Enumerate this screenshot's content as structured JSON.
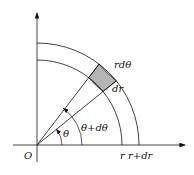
{
  "diagram": {
    "labels": {
      "origin": "O",
      "r_axis": "r",
      "r_plus_dr_axis": "r+dr",
      "theta": "θ",
      "theta_plus_dtheta": "θ+dθ",
      "arc_length": "rdθ",
      "radial_width": "dr"
    },
    "colors": {
      "line": "#111111",
      "shade": "#b4b4b4"
    },
    "geometry": {
      "origin": [
        37,
        145
      ],
      "inner_radius": 85,
      "outer_radius": 102,
      "theta_deg": 39,
      "theta_plus_dtheta_deg": 52.5
    }
  }
}
